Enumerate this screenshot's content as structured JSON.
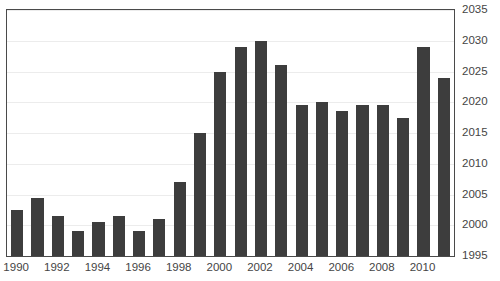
{
  "chart_data": {
    "type": "bar",
    "title": "",
    "xlabel": "",
    "ylabel": "",
    "categories": [
      "1990",
      "1991",
      "1992",
      "1993",
      "1994",
      "1995",
      "1996",
      "1997",
      "1998",
      "1999",
      "2000",
      "2001",
      "2002",
      "2003",
      "2004",
      "2005",
      "2006",
      "2007",
      "2008",
      "2009",
      "2010",
      "2011"
    ],
    "values": [
      2002.5,
      2004.5,
      2001.5,
      1999.0,
      2000.5,
      2001.5,
      1999.0,
      2001.0,
      2007.0,
      2015.0,
      2025.0,
      2029.0,
      2030.0,
      2026.0,
      2019.5,
      2020.0,
      2018.5,
      2019.5,
      2019.5,
      2017.5,
      2029.0,
      2024.0
    ],
    "ylim": [
      1995,
      2035
    ],
    "ytick_step": 5,
    "ytick_labels": [
      "1995",
      "2000",
      "2005",
      "2010",
      "2015",
      "2020",
      "2025",
      "2030",
      "2035"
    ],
    "ytick_values": [
      1995,
      2000,
      2005,
      2010,
      2015,
      2020,
      2025,
      2030,
      2035
    ],
    "y_axis_position": "right",
    "xtick_labels": [
      "1990",
      "1992",
      "1994",
      "1996",
      "1998",
      "2000",
      "2002",
      "2004",
      "2006",
      "2008",
      "2010"
    ],
    "xtick_values": [
      1990,
      1992,
      1994,
      1996,
      1998,
      2000,
      2002,
      2004,
      2006,
      2008,
      2010
    ],
    "grid": true,
    "grid_axis": "y",
    "legend": null,
    "legend_position": "none",
    "bar_color": "#3d3d3d",
    "grid_color": "#ececec",
    "frame_color": "#4a4a4a",
    "text_color": "#454545",
    "background_color": "#ffffff"
  },
  "title_ghost": ""
}
